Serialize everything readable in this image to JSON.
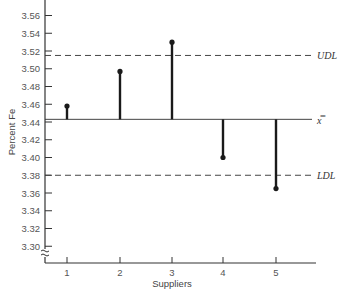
{
  "chart_data": {
    "type": "stem",
    "title": "",
    "xlabel": "Suppliers",
    "ylabel": "Percent Fe",
    "categories": [
      "1",
      "2",
      "3",
      "4",
      "5"
    ],
    "series": [
      {
        "name": "Supplier mean Fe",
        "values": [
          3.458,
          3.497,
          3.53,
          3.4,
          3.365
        ]
      }
    ],
    "reference_lines": [
      {
        "name": "UDL",
        "label": "UDL",
        "value": 3.515,
        "style": "dashed"
      },
      {
        "name": "grand-mean",
        "label": "x̿",
        "value": 3.443,
        "style": "solid"
      },
      {
        "name": "LDL",
        "label": "LDL",
        "value": 3.38,
        "style": "dashed"
      }
    ],
    "yticks": [
      "3.30",
      "3.32",
      "3.34",
      "3.36",
      "3.38",
      "3.40",
      "3.42",
      "3.44",
      "3.46",
      "3.48",
      "3.50",
      "3.52",
      "3.54",
      "3.56"
    ],
    "ylim": [
      3.28,
      3.58
    ],
    "axis_break": true,
    "grid": false,
    "legend": "none"
  },
  "colors": {
    "stem": "#1a1a1a",
    "axis": "#333333",
    "reference": "#444444",
    "text": "#555555"
  }
}
